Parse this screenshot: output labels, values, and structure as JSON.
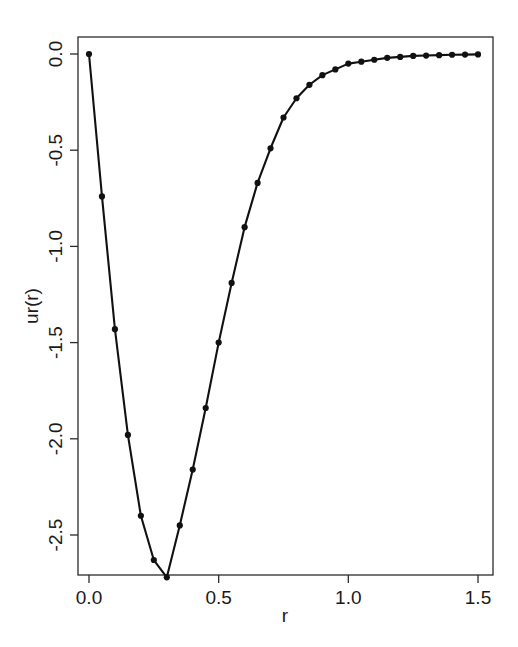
{
  "chart_data": {
    "type": "line",
    "title": "",
    "subtitle": "",
    "xlabel": "r",
    "ylabel": "ur(r)",
    "xlim": [
      0.0,
      1.5
    ],
    "ylim": [
      -2.8,
      0.05
    ],
    "grid": false,
    "legend": null,
    "marker": "filled-circle",
    "line_color": "#111111",
    "marker_color": "#111111",
    "background_color": "#ffffff",
    "axis_color": "#2b2b2b",
    "xticks": [
      0.0,
      0.5,
      1.0,
      1.5
    ],
    "xtick_labels": [
      "0.0",
      "0.5",
      "1.0",
      "1.5"
    ],
    "yticks": [
      0.0,
      -0.5,
      -1.0,
      -1.5,
      -2.0,
      -2.5
    ],
    "ytick_labels": [
      "0.0",
      "-0.5",
      "-1.0",
      "-1.5",
      "-2.0",
      "-2.5"
    ],
    "x": [
      0.0,
      0.05,
      0.1,
      0.15,
      0.2,
      0.25,
      0.3,
      0.35,
      0.4,
      0.45,
      0.5,
      0.55,
      0.6,
      0.65,
      0.7,
      0.75,
      0.8,
      0.85,
      0.9,
      0.95,
      1.0,
      1.05,
      1.1,
      1.15,
      1.2,
      1.25,
      1.3,
      1.35,
      1.4,
      1.45,
      1.5
    ],
    "values": [
      0.0,
      -0.74,
      -1.43,
      -1.98,
      -2.4,
      -2.63,
      -2.72,
      -2.45,
      -2.16,
      -1.84,
      -1.5,
      -1.19,
      -0.9,
      -0.67,
      -0.49,
      -0.33,
      -0.23,
      -0.16,
      -0.11,
      -0.08,
      -0.05,
      -0.04,
      -0.03,
      -0.02,
      -0.015,
      -0.01,
      -0.008,
      -0.006,
      -0.004,
      -0.003,
      -0.002
    ],
    "series": [
      {
        "name": "ur(r)",
        "values": [
          0.0,
          -0.74,
          -1.43,
          -1.98,
          -2.4,
          -2.63,
          -2.72,
          -2.45,
          -2.16,
          -1.84,
          -1.5,
          -1.19,
          -0.9,
          -0.67,
          -0.49,
          -0.33,
          -0.23,
          -0.16,
          -0.11,
          -0.08,
          -0.05,
          -0.04,
          -0.03,
          -0.02,
          -0.015,
          -0.01,
          -0.008,
          -0.006,
          -0.004,
          -0.003,
          -0.002
        ]
      }
    ],
    "minimum": {
      "x": 0.23,
      "y": -2.72
    }
  },
  "axes": {
    "x_title": "r",
    "y_title": "ur(r)"
  }
}
